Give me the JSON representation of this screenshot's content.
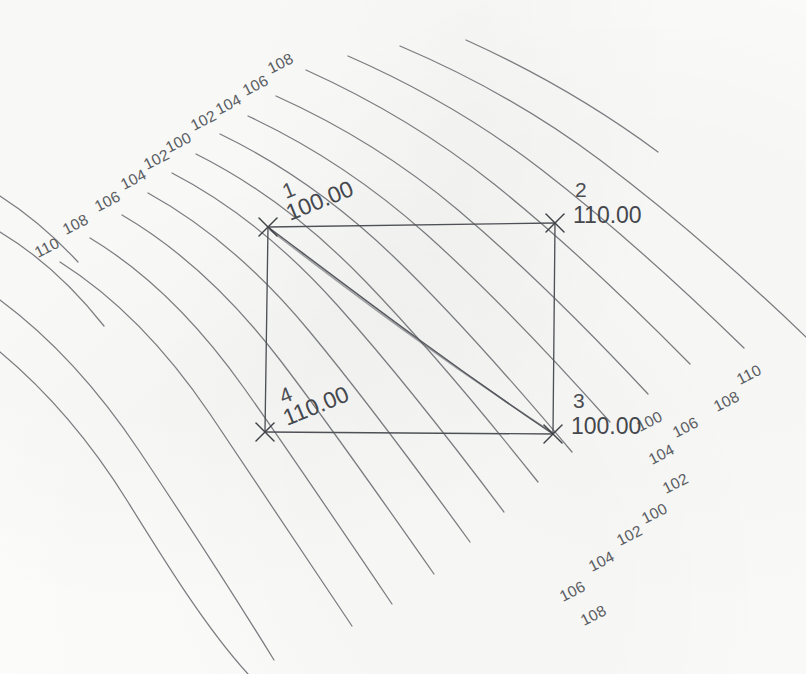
{
  "drawing": {
    "title": "Bilinear saddle surface contour plot",
    "medium": "scanned line drawing",
    "paper_color": "#fdfdfc",
    "line_color": "#6f7175",
    "label_color": "#5a5d62"
  },
  "chart_data": {
    "type": "line",
    "subtype": "contour-map",
    "title": "",
    "xlabel": "",
    "ylabel": "",
    "grid": false,
    "legend": false,
    "contour_interval": 2,
    "contour_min": 100,
    "contour_max": 110,
    "contour_levels": [
      100,
      102,
      104,
      106,
      108,
      110
    ],
    "surface_note": "Saddle: corners 1 and 3 at 100.00, corners 2 and 4 at 110.00",
    "corners": [
      {
        "id": "1",
        "value": "100.00",
        "elevation": 100,
        "position": "top-left",
        "x": 268,
        "y": 227
      },
      {
        "id": "2",
        "value": "110.00",
        "elevation": 110,
        "position": "top-right",
        "x": 555,
        "y": 223
      },
      {
        "id": "3",
        "value": "100.00",
        "elevation": 100,
        "position": "bottom-right",
        "x": 553,
        "y": 434
      },
      {
        "id": "4",
        "value": "110.00",
        "elevation": 110,
        "position": "bottom-left",
        "x": 265,
        "y": 432
      }
    ],
    "upper_left_labels": [
      {
        "text": "110",
        "x": 38,
        "y": 258
      },
      {
        "text": "108",
        "x": 66,
        "y": 235
      },
      {
        "text": "106",
        "x": 98,
        "y": 212
      },
      {
        "text": "104",
        "x": 124,
        "y": 190
      },
      {
        "text": "102",
        "x": 147,
        "y": 170
      },
      {
        "text": "100",
        "x": 169,
        "y": 153
      },
      {
        "text": "102",
        "x": 194,
        "y": 131
      },
      {
        "text": "104",
        "x": 219,
        "y": 115
      },
      {
        "text": "106",
        "x": 246,
        "y": 96
      },
      {
        "text": "108",
        "x": 271,
        "y": 74
      }
    ],
    "lower_right_labels": [
      {
        "text": "110",
        "x": 740,
        "y": 385
      },
      {
        "text": "108",
        "x": 717,
        "y": 412
      },
      {
        "text": "106",
        "x": 676,
        "y": 438
      },
      {
        "text": "100",
        "x": 640,
        "y": 432
      },
      {
        "text": "104",
        "x": 652,
        "y": 465
      },
      {
        "text": "102",
        "x": 666,
        "y": 494
      },
      {
        "text": "100",
        "x": 645,
        "y": 524
      },
      {
        "text": "102",
        "x": 620,
        "y": 546
      },
      {
        "text": "104",
        "x": 592,
        "y": 572
      },
      {
        "text": "106",
        "x": 563,
        "y": 602
      },
      {
        "text": "108",
        "x": 584,
        "y": 626
      }
    ]
  }
}
